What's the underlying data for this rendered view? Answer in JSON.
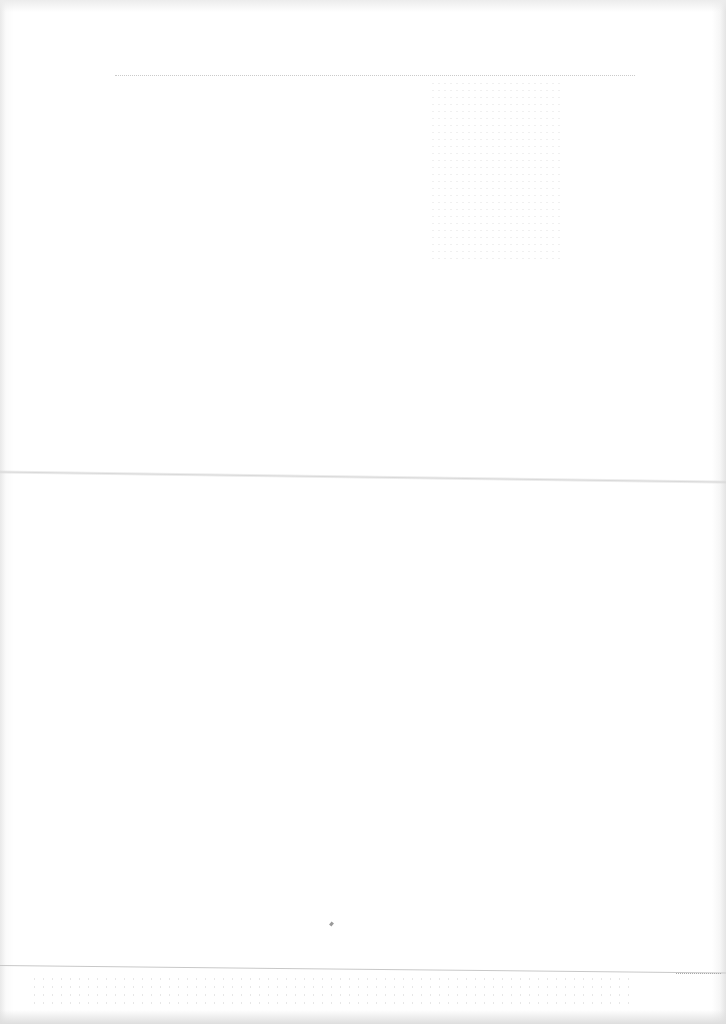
{
  "document": {
    "type": "scanned blank page",
    "text_content": [],
    "features": {
      "fold_line": "horizontal fold across middle of page",
      "header_rule": "faint dotted line near top",
      "footer_rule": "thin line near bottom with illegible faint marks"
    }
  }
}
